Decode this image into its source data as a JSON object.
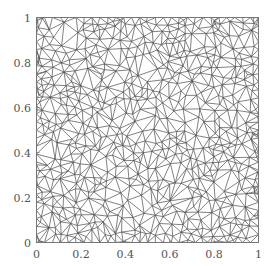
{
  "chart_data": {
    "type": "scatter",
    "subtype": "triangular_mesh",
    "title": "",
    "xlabel": "",
    "ylabel": "",
    "xlim": [
      0,
      1
    ],
    "ylim": [
      0,
      1
    ],
    "grid": false,
    "legend": null,
    "x_ticks": [
      0,
      0.2,
      0.4,
      0.6,
      0.8,
      1
    ],
    "x_tick_labels": [
      "0",
      "0.2",
      "0.4",
      "0.6",
      "0.8",
      "1"
    ],
    "y_ticks": [
      0,
      0.2,
      0.4,
      0.6,
      0.8,
      1
    ],
    "y_tick_labels": [
      "0",
      "0.2",
      "0.4",
      "0.6",
      "0.8",
      "1"
    ],
    "approx_node_count": 700,
    "edge_color": "#4a4a4a",
    "axes_color": "#777777"
  }
}
